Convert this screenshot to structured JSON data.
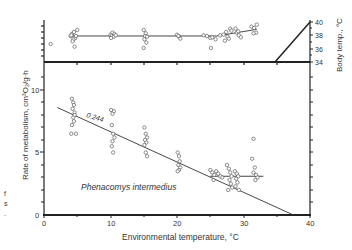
{
  "chart_data": {
    "type": "scatter",
    "title": "",
    "species_label": "Phenacomys intermedius",
    "slope_label": "0.244",
    "xlabel": "Environmental temperature, °C",
    "ylabel": "Rate of metabolism, cm³O₂/g·h",
    "y2label": "Body temp., °C",
    "xlim": [
      0,
      40
    ],
    "ylim": [
      0,
      12
    ],
    "y2lim": [
      34,
      40
    ],
    "x_ticks": [
      0,
      10,
      20,
      30,
      40
    ],
    "y_ticks": [
      0,
      5,
      10
    ],
    "y2_ticks": [
      34,
      36,
      38,
      40
    ],
    "grid": false,
    "series": [
      {
        "name": "Metabolic rate",
        "points": [
          [
            4.2,
            9.3
          ],
          [
            4.4,
            9.0
          ],
          [
            4.5,
            8.8
          ],
          [
            4.3,
            8.5
          ],
          [
            4.6,
            8.2
          ],
          [
            4.4,
            7.8
          ],
          [
            4.5,
            7.5
          ],
          [
            4.2,
            7.2
          ],
          [
            4.1,
            6.5
          ],
          [
            4.8,
            6.5
          ],
          [
            4.6,
            8.0
          ],
          [
            10.1,
            8.4
          ],
          [
            10.5,
            8.3
          ],
          [
            10.3,
            8.1
          ],
          [
            10.2,
            7.2
          ],
          [
            10.4,
            6.5
          ],
          [
            10.6,
            6.2
          ],
          [
            10.3,
            5.9
          ],
          [
            10.2,
            5.5
          ],
          [
            10.4,
            5.0
          ],
          [
            15.1,
            7.0
          ],
          [
            15.3,
            6.5
          ],
          [
            15.5,
            6.2
          ],
          [
            15.2,
            6.0
          ],
          [
            15.4,
            5.8
          ],
          [
            15.1,
            5.6
          ],
          [
            15.3,
            5.0
          ],
          [
            15.5,
            4.7
          ],
          [
            20.1,
            5.0
          ],
          [
            20.3,
            4.7
          ],
          [
            20.4,
            4.3
          ],
          [
            20.2,
            4.0
          ],
          [
            20.5,
            3.8
          ],
          [
            20.3,
            3.6
          ],
          [
            20.1,
            3.5
          ],
          [
            25.0,
            3.6
          ],
          [
            25.3,
            3.4
          ],
          [
            25.6,
            3.2
          ],
          [
            25.9,
            3.5
          ],
          [
            26.2,
            3.3
          ],
          [
            26.5,
            3.1
          ],
          [
            25.5,
            2.8
          ],
          [
            26.8,
            3.0
          ],
          [
            27.5,
            4.0
          ],
          [
            27.8,
            3.7
          ],
          [
            28.0,
            3.4
          ],
          [
            28.2,
            3.1
          ],
          [
            27.9,
            2.8
          ],
          [
            28.1,
            2.5
          ],
          [
            28.3,
            2.2
          ],
          [
            27.7,
            2.0
          ],
          [
            28.7,
            3.5
          ],
          [
            29.0,
            3.3
          ],
          [
            29.2,
            3.1
          ],
          [
            28.9,
            2.9
          ],
          [
            29.1,
            2.6
          ],
          [
            28.8,
            2.3
          ],
          [
            29.3,
            2.0
          ],
          [
            31.5,
            6.1
          ],
          [
            31.3,
            4.5
          ],
          [
            31.7,
            3.8
          ],
          [
            31.5,
            3.4
          ],
          [
            31.9,
            3.2
          ],
          [
            32.1,
            3.0
          ],
          [
            31.8,
            2.8
          ]
        ]
      },
      {
        "name": "Body temperature",
        "axis": "y2",
        "points": [
          [
            1.0,
            36.7
          ],
          [
            4.0,
            37.9
          ],
          [
            4.2,
            38.2
          ],
          [
            4.5,
            38.5
          ],
          [
            4.7,
            37.6
          ],
          [
            4.4,
            37.4
          ],
          [
            4.8,
            37.9
          ],
          [
            4.3,
            37.1
          ],
          [
            4.6,
            36.3
          ],
          [
            5.0,
            38.8
          ],
          [
            4.1,
            38.0
          ],
          [
            10.0,
            38.1
          ],
          [
            10.3,
            38.4
          ],
          [
            10.6,
            38.2
          ],
          [
            10.2,
            37.9
          ],
          [
            10.5,
            37.8
          ],
          [
            10.8,
            38.0
          ],
          [
            10.1,
            37.6
          ],
          [
            15.0,
            38.8
          ],
          [
            15.3,
            38.3
          ],
          [
            15.2,
            37.9
          ],
          [
            15.1,
            37.4
          ],
          [
            15.4,
            36.9
          ],
          [
            15.0,
            36.1
          ],
          [
            15.5,
            37.8
          ],
          [
            20.0,
            38.1
          ],
          [
            20.3,
            37.8
          ],
          [
            20.5,
            37.5
          ],
          [
            20.2,
            37.9
          ],
          [
            24.0,
            38.0
          ],
          [
            24.5,
            37.9
          ],
          [
            25.0,
            37.6
          ],
          [
            25.3,
            37.7
          ],
          [
            25.8,
            37.4
          ],
          [
            25.1,
            36.1
          ],
          [
            26.5,
            38.0
          ],
          [
            27.0,
            38.1
          ],
          [
            27.4,
            38.5
          ],
          [
            27.6,
            37.8
          ],
          [
            27.8,
            37.5
          ],
          [
            27.2,
            37.2
          ],
          [
            28.0,
            39.0
          ],
          [
            28.2,
            38.7
          ],
          [
            28.8,
            39.0
          ],
          [
            29.0,
            38.4
          ],
          [
            29.3,
            38.0
          ],
          [
            29.6,
            37.7
          ],
          [
            29.2,
            38.6
          ],
          [
            31.2,
            39.3
          ],
          [
            31.6,
            39.1
          ],
          [
            31.9,
            38.4
          ],
          [
            32.0,
            39.6
          ],
          [
            31.5,
            38.3
          ]
        ]
      }
    ],
    "lines": [
      {
        "name": "Metabolism regression",
        "x": [
          2,
          37.5
        ],
        "y": [
          8.6,
          0
        ]
      },
      {
        "name": "Metabolism plateau",
        "x": [
          25,
          33
        ],
        "y": [
          3.1,
          3.1
        ]
      },
      {
        "name": "Body temp. (low)",
        "x": [
          4,
          26
        ],
        "y2": [
          37.9,
          37.9
        ]
      },
      {
        "name": "Body temp. (high)",
        "x": [
          26,
          32
        ],
        "y2": [
          37.9,
          38.9
        ]
      }
    ],
    "legend": "none"
  },
  "side_text": {
    "line1": "f",
    "line2": "s",
    "line3": "."
  }
}
